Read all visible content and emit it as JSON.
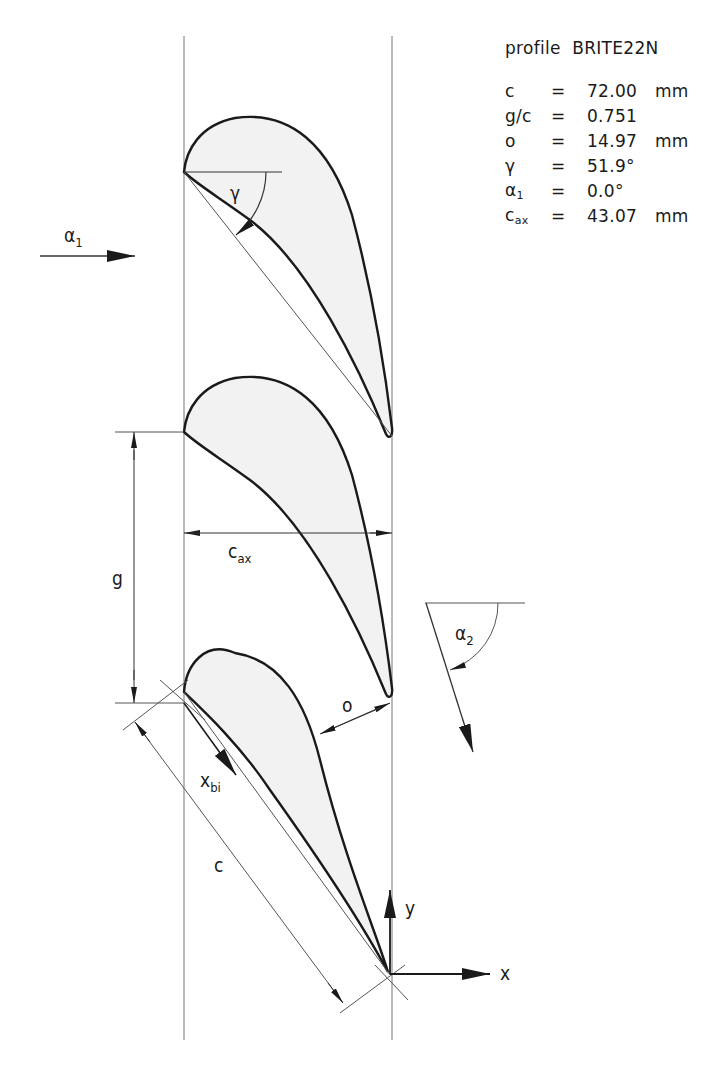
{
  "info": {
    "title_prefix": "profile",
    "profile_name": "BRITE22N",
    "params": [
      {
        "symbol": "c",
        "sub": "",
        "eq": "=",
        "value": "72.00",
        "unit": "mm"
      },
      {
        "symbol": "g/c",
        "sub": "",
        "eq": "=",
        "value": "0.751",
        "unit": ""
      },
      {
        "symbol": "o",
        "sub": "",
        "eq": "=",
        "value": "14.97",
        "unit": "mm"
      },
      {
        "symbol": "γ",
        "sub": "",
        "eq": "=",
        "value": "51.9°",
        "unit": ""
      },
      {
        "symbol": "α",
        "sub": "1",
        "eq": "=",
        "value": "0.0°",
        "unit": ""
      },
      {
        "symbol": "c",
        "sub": "ax",
        "eq": "=",
        "value": "43.07",
        "unit": "mm"
      }
    ]
  },
  "labels": {
    "alpha1": "α",
    "alpha1_sub": "1",
    "gamma": "γ",
    "cax": "c",
    "cax_sub": "ax",
    "g": "g",
    "alpha2": "α",
    "alpha2_sub": "2",
    "o": "o",
    "xbi": "x",
    "xbi_sub": "bi",
    "c": "c",
    "y": "y",
    "x": "x"
  },
  "colors": {
    "line": "#1a1a1a",
    "thin": "#555555",
    "fill": "#f2f2f2"
  }
}
